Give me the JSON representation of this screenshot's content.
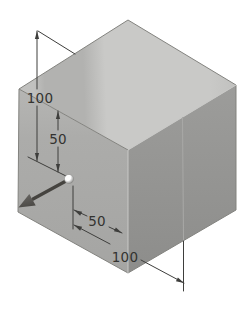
{
  "figure": {
    "name": "isometric-cube-dimension-sketch",
    "background": "#ffffff",
    "dimensions": {
      "height_total": "100",
      "height_to_point": "50",
      "width_to_point": "50",
      "width_total": "100"
    },
    "colors": {
      "annotation_line": "#3e3e3c",
      "label_text": "#333330",
      "top_face_light": "#c9c9c7",
      "top_face_band": "#b2b2b0",
      "top_face_edge_tint": "#c1c1bf",
      "left_face_top": "#b5b5b3",
      "left_face": "#acacaa",
      "left_face_bottom": "#a5a5a3",
      "right_face_top": "#9c9c9a",
      "right_face_bottom": "#8d8d8b",
      "edge_dark": "#83837f",
      "edge_light": "#c8c8c6",
      "ext_line_over_face": "#a9a9a7",
      "pointer_arrow_dark": "#45433f",
      "pointer_arrow_light": "#6b6966",
      "sphere_highlight": "#ffffff",
      "sphere_shadow": "#8f8f8d"
    }
  }
}
